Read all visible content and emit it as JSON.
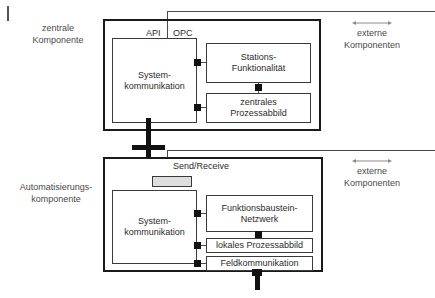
{
  "figure": {
    "corner_tick": "figure-corner-mark"
  },
  "captions": {
    "left_top_line1": "zentrale",
    "left_top_line2": "Komponente",
    "left_bottom_line1": "Automatisierungs-",
    "left_bottom_line2": "komponente",
    "right_top_line1": "externe",
    "right_top_line2": "Komponenten",
    "right_bottom_line1": "externe",
    "right_bottom_line2": "Komponenten"
  },
  "central_component": {
    "interface_labels": {
      "api": "API",
      "opc": "OPC"
    },
    "boxes": [
      {
        "name": "systemkommunikation",
        "line1": "System-",
        "line2": "kommunikation"
      },
      {
        "name": "stations-funktionalitaet",
        "line1": "Stations-",
        "line2": "Funktionalität"
      },
      {
        "name": "zentrales-prozessabbild",
        "line1": "zentrales",
        "line2": "Prozessabbild"
      }
    ]
  },
  "automation_component": {
    "interface_labels": {
      "send_receive": "Send/Receive"
    },
    "boxes": [
      {
        "name": "systemkommunikation",
        "line1": "System-",
        "line2": "kommunikation"
      },
      {
        "name": "funktionsbaustein-netzwerk",
        "line1": "Funktionsbaustein-",
        "line2": "Netzwerk"
      },
      {
        "name": "lokales-prozessabbild",
        "line1": "lokales Prozessabbild",
        "line2": ""
      },
      {
        "name": "feldkommunikation",
        "line1": "Feldkommunikation",
        "line2": ""
      }
    ]
  },
  "colors": {
    "frame": "#1a1a1a",
    "box_border": "#3a3a3a",
    "bus": "#111111",
    "text": "#2b2b2b",
    "caption_text": "#4a4a4a",
    "line": "#4a4a4a",
    "arrow": "#8a8a8a",
    "grey_block_fill": "#dedede",
    "background": "#ffffff"
  }
}
